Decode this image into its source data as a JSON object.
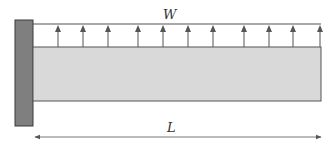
{
  "diagram": {
    "type": "cantilever beam with uniformly distributed upward load",
    "load_label": "W",
    "length_label": "L",
    "arrow_count": 11,
    "arrow_x": [
      58,
      83,
      108,
      138,
      163,
      188,
      213,
      244,
      269,
      293,
      320
    ],
    "colors": {
      "wall_fill": "#7f7f7f",
      "wall_stroke": "#3a3a3a",
      "beam_fill": "#d9d9d9",
      "beam_stroke": "#555555",
      "line": "#555555",
      "text": "#333333"
    }
  }
}
